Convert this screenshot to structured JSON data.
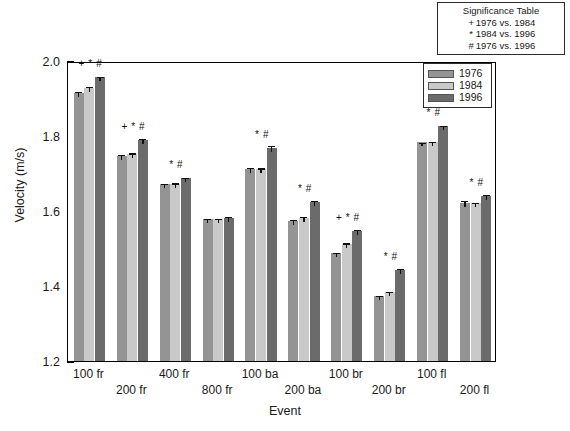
{
  "significance_table": {
    "title": "Significance Table",
    "rows": [
      {
        "symbol": "+",
        "text": "1976 vs. 1984"
      },
      {
        "symbol": "*",
        "text": "1984 vs. 1996"
      },
      {
        "symbol": "#",
        "text": "1976 vs. 1996"
      }
    ]
  },
  "legend": {
    "entries": [
      {
        "label": "1976",
        "color": "#949494"
      },
      {
        "label": "1984",
        "color": "#c9c9c9"
      },
      {
        "label": "1996",
        "color": "#6b6b6b"
      }
    ]
  },
  "chart_data": {
    "type": "bar",
    "title": "",
    "xlabel": "Event",
    "ylabel": "Velocity (m/s)",
    "ylim": [
      1.2,
      2.0
    ],
    "ytick_labels": [
      "1.2",
      "1.4",
      "1.6",
      "1.8",
      "2.0"
    ],
    "ytick_values": [
      1.2,
      1.4,
      1.6,
      1.8,
      2.0
    ],
    "yminor_values": [
      1.3,
      1.5,
      1.7,
      1.9
    ],
    "grid": false,
    "legend_position": "top-right inside",
    "categories": [
      "100 fr",
      "200 fr",
      "400 fr",
      "800 fr",
      "100 ba",
      "200 ba",
      "100 br",
      "200 br",
      "100 fl",
      "200 fl"
    ],
    "series": [
      {
        "name": "1976",
        "color": "#949494",
        "values": [
          1.915,
          1.748,
          1.672,
          1.578,
          1.712,
          1.574,
          1.487,
          1.374,
          1.783,
          1.622
        ],
        "errors": [
          0.008,
          0.007,
          0.006,
          0.006,
          0.008,
          0.007,
          0.007,
          0.006,
          0.005,
          0.01
        ]
      },
      {
        "name": "1984",
        "color": "#c9c9c9",
        "values": [
          1.928,
          1.753,
          1.673,
          1.578,
          1.712,
          1.582,
          1.512,
          1.383,
          1.785,
          1.622
        ],
        "errors": [
          0.008,
          0.006,
          0.006,
          0.006,
          0.007,
          0.007,
          0.007,
          0.006,
          0.004,
          0.006
        ]
      },
      {
        "name": "1996",
        "color": "#6b6b6b",
        "values": [
          1.958,
          1.79,
          1.687,
          1.582,
          1.768,
          1.625,
          1.547,
          1.443,
          1.827,
          1.64
        ],
        "errors": [
          0.006,
          0.007,
          0.006,
          0.008,
          0.01,
          0.007,
          0.007,
          0.007,
          0.006,
          0.008
        ]
      }
    ],
    "annotations": [
      {
        "category": "100 fr",
        "marker": "+ * #"
      },
      {
        "category": "200 fr",
        "marker": "+ * #"
      },
      {
        "category": "400 fr",
        "marker": "* #"
      },
      {
        "category": "800 fr",
        "marker": ""
      },
      {
        "category": "100 ba",
        "marker": "* #"
      },
      {
        "category": "200 ba",
        "marker": "* #"
      },
      {
        "category": "100 br",
        "marker": "+ * #"
      },
      {
        "category": "200 br",
        "marker": "* #"
      },
      {
        "category": "100 fl",
        "marker": "* #"
      },
      {
        "category": "200 fl",
        "marker": "* #"
      }
    ]
  }
}
